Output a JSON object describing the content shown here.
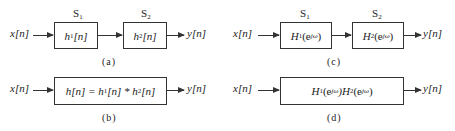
{
  "diagrams": {
    "a": {
      "caption": "(a)",
      "input": "x[n]",
      "output": "y[n]",
      "blocks": [
        {
          "system": "S",
          "system_sub": "1",
          "label": "h",
          "label_sub": "1",
          "label_tail": "[n]"
        },
        {
          "system": "S",
          "system_sub": "2",
          "label": "h",
          "label_sub": "2",
          "label_tail": "[n]"
        }
      ]
    },
    "b": {
      "caption": "(b)",
      "input": "x[n]",
      "output": "y[n]",
      "block": {
        "p1": "h[n] = h",
        "s1": "1",
        "p2": "[n] * h",
        "s2": "2",
        "p3": "[n]"
      }
    },
    "c": {
      "caption": "(c)",
      "input": "x[n]",
      "output": "y[n]",
      "blocks": [
        {
          "system": "S",
          "system_sub": "1",
          "label": "H",
          "label_sub": "1",
          "label_pre": "(e",
          "label_sup": "jω",
          "label_tail": ")"
        },
        {
          "system": "S",
          "system_sub": "2",
          "label": "H",
          "label_sub": "2",
          "label_pre": "(e",
          "label_sup": "jω",
          "label_tail": ")"
        }
      ]
    },
    "d": {
      "caption": "(d)",
      "input": "x[n]",
      "output": "y[n]",
      "block": {
        "p1": "H",
        "s1": "1",
        "p2": "(e",
        "sup1": "jω",
        "p3": ")H",
        "s2": "2",
        "p4": "(e",
        "sup2": "jω",
        "p5": ")"
      }
    }
  }
}
